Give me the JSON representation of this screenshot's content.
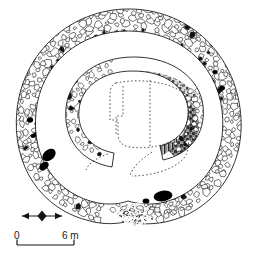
{
  "figure": {
    "type": "archaeological-site-plan",
    "background_color": "#ffffff",
    "ink_color": "#1a1a1a"
  },
  "scale_bar": {
    "name": "scale-bar",
    "start_label": "0",
    "end_label": "6 m",
    "units": "m",
    "length_value": 6,
    "pixel_length": 57,
    "tick_labels": [
      "0",
      "6 m"
    ]
  },
  "north_arrow": {
    "name": "north-arrow",
    "style": "double-headed-lozenge-arrow",
    "direction": "east-right",
    "label": ""
  },
  "features": [
    {
      "id": "outer-ring-wall",
      "label": "Outer ring wall",
      "render": "rubble-stone-mass",
      "fill": "white-stones-black-outline",
      "shape": "annulus",
      "entrance_position": "south"
    },
    {
      "id": "inner-enclosure-wall",
      "label": "Inner horseshoe wall",
      "render": "stippled-shaded-masonry",
      "fill": "mottled-grey",
      "shape": "horseshoe",
      "opening_position": "south-southeast"
    },
    {
      "id": "reconstruction-outline",
      "label": "Conjectural outline",
      "render": "dotted-line",
      "shape": "rounded-rectangle"
    },
    {
      "id": "orthostat-dark-stones",
      "label": "Orthostats / solid stones",
      "render": "solid-black-fill"
    },
    {
      "id": "rubble-scatter",
      "label": "Rubble / paving scatter",
      "render": "fine-stipple",
      "position": "south-entrance"
    }
  ],
  "colors": {
    "ink": "#1a1a1a",
    "stone_fill": "#ffffff",
    "shade_light": "#b8b8b8",
    "shade_mid": "#8a8a8a",
    "shade_dark": "#4a4a4a",
    "solid": "#000000",
    "background": "#ffffff"
  }
}
